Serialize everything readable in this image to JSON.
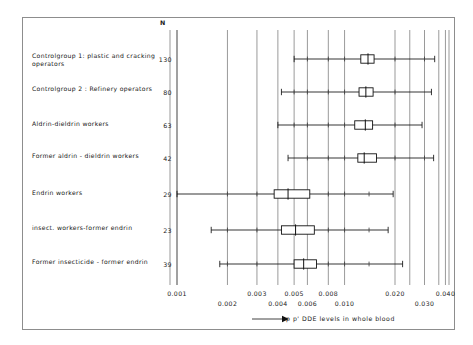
{
  "figure": {
    "n_header": "N",
    "axis_title": "p p' DDE levels in whole blood",
    "arrow_glyph": "arrow-right-icon"
  },
  "chart_data": {
    "type": "box",
    "title": "",
    "xlabel": "p p' DDE levels in whole blood",
    "ylabel": "",
    "xscale": "log",
    "xlim": [
      0.0009,
      0.045
    ],
    "grid": true,
    "legend": "none",
    "xticks": [
      0.001,
      0.002,
      0.003,
      0.004,
      0.005,
      0.006,
      0.008,
      0.01,
      0.02,
      0.03,
      0.04
    ],
    "xtick_labels": [
      "0.001",
      "0.002",
      "0.003",
      "0.004",
      "0.005",
      "0.006",
      "0.008",
      "0.010",
      "0.020",
      "0.030",
      "0.040"
    ],
    "xtick_label_rows": [
      0,
      1,
      0,
      1,
      0,
      1,
      0,
      1,
      0,
      1,
      0
    ],
    "categories": [
      "Controlgroup 1: plastic and cracking operators",
      "Controlgroup 2 : Refinery operators",
      "Aldrin-dieldrin workers",
      "Former aldrin - dieldrin workers",
      "Endrin workers",
      "insect. workers-former endrin",
      "Former insecticide - former endrin"
    ],
    "counts": [
      130,
      80,
      63,
      42,
      29,
      23,
      39
    ],
    "boxes": [
      {
        "group": "Controlgroup 1: plastic and cracking operators",
        "n": 130,
        "whisker_low": 0.005,
        "q1": 0.0125,
        "median": 0.0138,
        "q3": 0.015,
        "whisker_high": 0.0345
      },
      {
        "group": "Controlgroup 2 : Refinery operators",
        "n": 80,
        "whisker_low": 0.0042,
        "q1": 0.0122,
        "median": 0.0134,
        "q3": 0.0148,
        "whisker_high": 0.033
      },
      {
        "group": "Aldrin-dieldrin workers",
        "n": 63,
        "whisker_low": 0.004,
        "q1": 0.0115,
        "median": 0.0133,
        "q3": 0.0147,
        "whisker_high": 0.029
      },
      {
        "group": "Former aldrin - dieldrin workers",
        "n": 42,
        "whisker_low": 0.0046,
        "q1": 0.012,
        "median": 0.0131,
        "q3": 0.0155,
        "whisker_high": 0.034
      },
      {
        "group": "Endrin workers",
        "n": 29,
        "whisker_low": 0.001,
        "q1": 0.0038,
        "median": 0.0046,
        "q3": 0.0062,
        "whisker_high": 0.0195
      },
      {
        "group": "insect. workers-former endrin",
        "n": 23,
        "whisker_low": 0.0016,
        "q1": 0.0042,
        "median": 0.0051,
        "q3": 0.0066,
        "whisker_high": 0.0182
      },
      {
        "group": "Former insecticide - former endrin",
        "n": 39,
        "whisker_low": 0.0018,
        "q1": 0.005,
        "median": 0.0057,
        "q3": 0.0068,
        "whisker_high": 0.0222
      }
    ],
    "whisker_internal_ticks": [
      [
        0.006,
        0.008,
        0.01,
        0.02,
        0.03
      ],
      [
        0.005,
        0.006,
        0.008,
        0.01,
        0.02
      ],
      [
        0.005,
        0.006,
        0.008,
        0.01,
        0.02
      ],
      [
        0.006,
        0.008,
        0.01,
        0.02,
        0.03
      ],
      [
        0.002,
        0.003,
        0.008,
        0.01,
        0.014
      ],
      [
        0.002,
        0.003,
        0.008,
        0.01,
        0.014
      ],
      [
        0.002,
        0.003,
        0.008,
        0.01,
        0.014
      ]
    ]
  }
}
